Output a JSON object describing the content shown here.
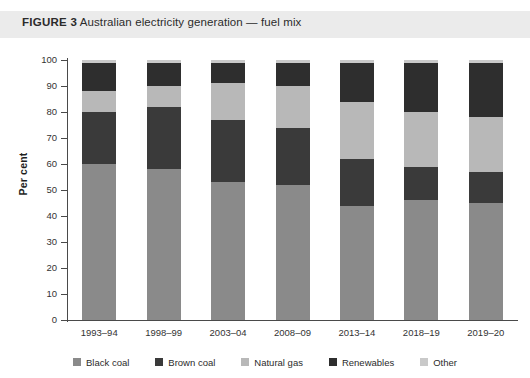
{
  "figure": {
    "label": "FIGURE 3",
    "title": "Australian electricity generation — fuel mix",
    "band_color": "#ebebeb"
  },
  "axes": {
    "y_axis_title": "Per cent",
    "y_ticks": [
      "0",
      "10",
      "20",
      "30",
      "40",
      "50",
      "60",
      "70",
      "80",
      "90",
      "100"
    ],
    "x_ticks": [
      "1993–94",
      "1998–99",
      "2003–04",
      "2008–09",
      "2013–14",
      "2018–19",
      "2019–20"
    ]
  },
  "legend": {
    "position": "bottom",
    "items": [
      {
        "label": "Black coal",
        "color": "#8a8a8a"
      },
      {
        "label": "Brown coal",
        "color": "#3a3a3a"
      },
      {
        "label": "Natural gas",
        "color": "#b8b8b8"
      },
      {
        "label": "Renewables",
        "color": "#2e2e2e"
      },
      {
        "label": "Other",
        "color": "#c9c9c9"
      }
    ]
  },
  "chart_data": {
    "type": "bar",
    "stacked": true,
    "title": "Australian electricity generation — fuel mix",
    "xlabel": "",
    "ylabel": "Per cent",
    "ylim": [
      0,
      100
    ],
    "ytick_step": 10,
    "grid": false,
    "categories": [
      "1993–94",
      "1998–99",
      "2003–04",
      "2008–09",
      "2013–14",
      "2018–19",
      "2019–20"
    ],
    "series": [
      {
        "name": "Black coal",
        "color": "#8a8a8a",
        "values": [
          60,
          58,
          53,
          52,
          44,
          46,
          45
        ]
      },
      {
        "name": "Brown coal",
        "color": "#3a3a3a",
        "values": [
          20,
          24,
          24,
          22,
          18,
          13,
          12
        ]
      },
      {
        "name": "Natural gas",
        "color": "#b8b8b8",
        "values": [
          8,
          8,
          14,
          16,
          22,
          21,
          21
        ]
      },
      {
        "name": "Renewables",
        "color": "#2e2e2e",
        "values": [
          11,
          9,
          8,
          9,
          15,
          19,
          21
        ]
      },
      {
        "name": "Other",
        "color": "#c9c9c9",
        "values": [
          1,
          1,
          1,
          1,
          1,
          1,
          1
        ]
      }
    ]
  }
}
